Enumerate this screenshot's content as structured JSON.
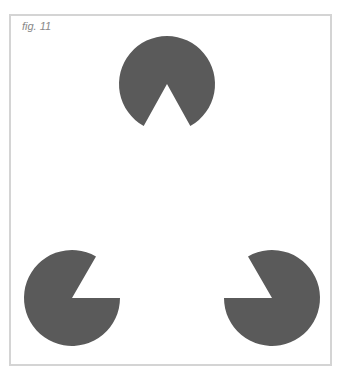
{
  "caption": "fig. 11",
  "colors": {
    "shape": "#5a5a5a",
    "border": "#d4d4d4",
    "background": "#ffffff",
    "caption": "#888888"
  },
  "shapes": [
    {
      "name": "pacman-top",
      "cx": 167,
      "cy": 84,
      "r": 48,
      "mouth": "down"
    },
    {
      "name": "pacman-bottom-left",
      "cx": 72,
      "cy": 298,
      "r": 48,
      "mouth": "upper-right"
    },
    {
      "name": "pacman-bottom-right",
      "cx": 272,
      "cy": 298,
      "r": 48,
      "mouth": "upper-left"
    }
  ]
}
